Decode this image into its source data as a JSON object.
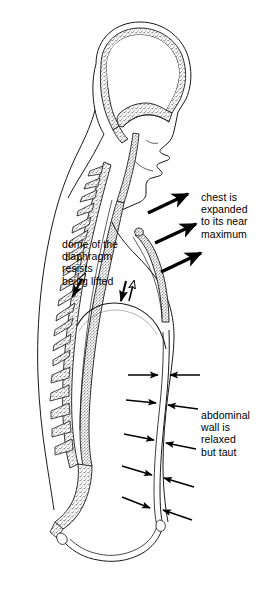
{
  "figure": {
    "style": {
      "background_color": "#ffffff",
      "line_color": "#1a1a1a",
      "stipple_color": "#808080",
      "arrow_color": "#000000",
      "text_color": "#000000"
    }
  },
  "annotations": [
    {
      "id": "chest",
      "text": "chest is\nexpanded\nto its near\nmaximum",
      "lines": [
        "chest is",
        "expanded",
        "to its near",
        "maximum"
      ]
    },
    {
      "id": "dome",
      "text": "dome of the\ndiaphragm\nresists\nbeing lifted",
      "lines": [
        "dome of the",
        "diaphragm",
        "resists",
        "being lifted"
      ]
    },
    {
      "id": "abdomen",
      "text": "abdominal\nwall is\nrelaxed\nbut taut",
      "lines": [
        "abdominal",
        "wall is",
        "relaxed",
        "but taut"
      ]
    }
  ],
  "arrow_groups": {
    "chest_expansion": {
      "label": "chest expansion arrows",
      "count": 3,
      "direction": "outward up-right",
      "style": "thick solid"
    },
    "diaphragm_opposition": {
      "label": "diaphragm opposing force arrows",
      "count": 4,
      "direction": "paired up and down",
      "style": "thin outlined"
    },
    "abdominal_pressure": {
      "label": "abdominal wall converging arrows",
      "count": 10,
      "direction": "inward converging pairs",
      "style": "thin solid"
    }
  },
  "anatomy_parts": [
    "skull",
    "brain cavity",
    "face profile",
    "nasal passage",
    "oral cavity",
    "cervical vertebrae",
    "thoracic vertebrae",
    "lumbar vertebrae",
    "sacrum",
    "spinal canal",
    "sternum",
    "thoracic cavity",
    "diaphragm dome",
    "abdominal wall",
    "pelvis"
  ]
}
